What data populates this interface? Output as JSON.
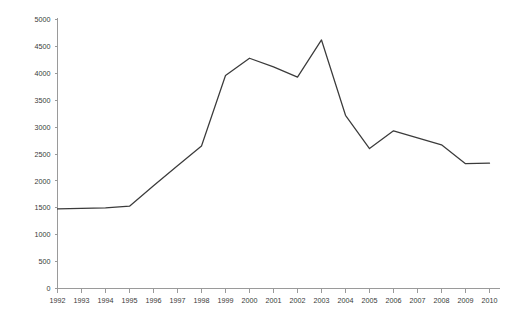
{
  "chart_data": {
    "type": "line",
    "title": "",
    "subtitle": "",
    "xlabel": "",
    "ylabel": "",
    "categories": [
      "1992",
      "1993",
      "1994",
      "1995",
      "1996",
      "1997",
      "1998",
      "1999",
      "2000",
      "2001",
      "2002",
      "2003",
      "2004",
      "2005",
      "2006",
      "2007",
      "2008",
      "2009",
      "2010"
    ],
    "x": [
      1992,
      1993,
      1994,
      1995,
      1996,
      1997,
      1998,
      1999,
      2000,
      2001,
      2002,
      2003,
      2004,
      2005,
      2006,
      2007,
      2008,
      2009,
      2010
    ],
    "values": [
      1480,
      1490,
      1500,
      1530,
      1910,
      2280,
      2650,
      3960,
      4280,
      4120,
      3930,
      4620,
      3220,
      2600,
      2930,
      2800,
      2670,
      2320,
      2330
    ],
    "series": [
      {
        "name": "series-1",
        "values": [
          1480,
          1490,
          1500,
          1530,
          1910,
          2280,
          2650,
          3960,
          4280,
          4120,
          3930,
          4620,
          3220,
          2600,
          2930,
          2800,
          2670,
          2320,
          2330
        ],
        "color": "#3b3b3b"
      }
    ],
    "ylim": [
      0,
      5000
    ],
    "yticks": [
      0,
      500,
      1000,
      1500,
      2000,
      2500,
      3000,
      3500,
      4000,
      4500,
      5000
    ],
    "ytick_labels": [
      "0",
      "500",
      "1000",
      "1500",
      "2000",
      "2500",
      "3000",
      "3500",
      "4000",
      "4500",
      "5000"
    ],
    "xtick_labels": [
      "1992",
      "1993",
      "1994",
      "1995",
      "1996",
      "1997",
      "1998",
      "1999",
      "2000",
      "2001",
      "2002",
      "2003",
      "2004",
      "2005",
      "2006",
      "2007",
      "2008",
      "2009",
      "2010"
    ],
    "grid": false,
    "legend": false,
    "legend_position": "none",
    "axis_color": "#9a9a9a",
    "line_color": "#3b3b3b",
    "background_color": "#ffffff"
  }
}
